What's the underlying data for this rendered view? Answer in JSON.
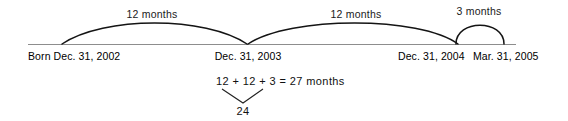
{
  "diagram": {
    "type": "timeline",
    "baseline": {
      "color": "#888888"
    },
    "arc_color": "#111111",
    "spans": [
      {
        "label": "12 months",
        "from": "Dec. 31, 2002",
        "to": "Dec. 31, 2003",
        "months": 12
      },
      {
        "label": "12 months",
        "from": "Dec. 31, 2003",
        "to": "Dec. 31, 2004",
        "months": 12
      },
      {
        "label": "3 months",
        "from": "Dec. 31, 2004",
        "to": "Mar. 31, 2005",
        "months": 3
      }
    ],
    "dates": [
      {
        "label": "Born Dec. 31, 2002"
      },
      {
        "label": "Dec. 31, 2003"
      },
      {
        "label": "Dec. 31, 2004"
      },
      {
        "label": "Mar. 31, 2005"
      }
    ],
    "equation": {
      "text": "12 + 12 + 3 = 27 months",
      "brace_result": "24"
    }
  }
}
